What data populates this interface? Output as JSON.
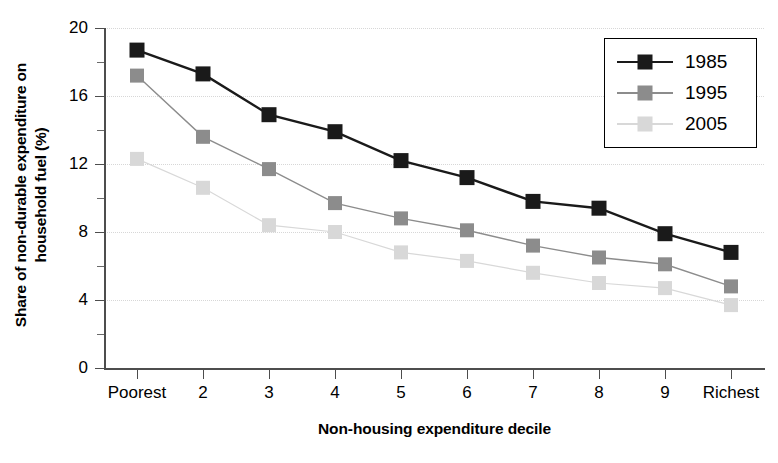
{
  "chart_data": {
    "type": "line",
    "title": "",
    "subtitle": "",
    "xlabel": "Non-housing expenditure decile",
    "ylabel": "Share of non-durable expenditure on household fuel (%)",
    "ylabel_line1": "Share of non-durable expenditure on",
    "ylabel_line2": "household fuel (%)",
    "categories": [
      "Poorest",
      "2",
      "3",
      "4",
      "5",
      "6",
      "7",
      "8",
      "9",
      "Richest"
    ],
    "series": [
      {
        "name": "1985",
        "color": "#1a1a1a",
        "values": [
          18.7,
          17.3,
          14.9,
          13.9,
          12.2,
          11.2,
          9.8,
          9.4,
          7.9,
          6.8
        ]
      },
      {
        "name": "1995",
        "color": "#8c8c8c",
        "values": [
          17.2,
          13.6,
          11.7,
          9.7,
          8.8,
          8.1,
          7.2,
          6.5,
          6.1,
          4.8
        ]
      },
      {
        "name": "2005",
        "color": "#d8d8d8",
        "values": [
          12.3,
          10.6,
          8.4,
          8.0,
          6.8,
          6.3,
          5.6,
          5.0,
          4.7,
          3.7
        ]
      }
    ],
    "ylim": [
      0,
      20
    ],
    "yticks": [
      0,
      4,
      8,
      12,
      16,
      20
    ],
    "ytick_labels": [
      "0",
      "4",
      "8",
      "12",
      "16",
      "20"
    ],
    "yminor_ticks": [
      2,
      6,
      10,
      14,
      18
    ],
    "grid": true,
    "grid_axis": "y",
    "grid_color": "#d7d7d7",
    "legend_position": "top-right",
    "marker": "square",
    "background": "#ffffff",
    "axis_color": "#4d4d4d"
  },
  "legend": {
    "entries": [
      {
        "label": "1985"
      },
      {
        "label": "1995"
      },
      {
        "label": "2005"
      }
    ]
  }
}
